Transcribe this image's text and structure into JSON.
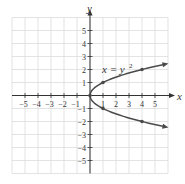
{
  "chart_data": {
    "type": "line",
    "title": "",
    "equation_label": "x = y",
    "equation_exponent": "2",
    "xlabel": "x",
    "ylabel": "y",
    "xlim": [
      -6,
      6
    ],
    "ylim": [
      -6,
      6
    ],
    "grid": true,
    "x_ticks": [
      -5,
      -4,
      -3,
      -2,
      -1,
      1,
      2,
      3,
      4,
      5
    ],
    "y_ticks": [
      -5,
      -4,
      -3,
      -2,
      -1,
      1,
      2,
      3,
      4,
      5
    ],
    "x_tick_labels": [
      "−5",
      "−4",
      "−3",
      "−2",
      "−1",
      "1",
      "2",
      "3",
      "4",
      "5"
    ],
    "y_tick_labels": [
      "−5",
      "−4",
      "−3",
      "−2",
      "−1",
      "1",
      "2",
      "3",
      "4",
      "5"
    ],
    "series": [
      {
        "name": "x = y^2",
        "marked_points": [
          [
            0,
            0
          ],
          [
            1,
            1
          ],
          [
            4,
            2
          ],
          [
            1,
            -1
          ],
          [
            4,
            -2
          ]
        ],
        "upper_branch_arrow_end": [
          5.8,
          2.41
        ],
        "lower_branch_arrow_end": [
          5.8,
          -2.41
        ]
      }
    ],
    "colors": {
      "curve": "#4a4a4a",
      "axes": "#333333",
      "grid": "#dcdcdc"
    }
  }
}
